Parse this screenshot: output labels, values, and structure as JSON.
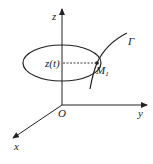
{
  "diagram": {
    "type": "3d-coordinate-system",
    "axes": {
      "z_label": "z",
      "y_label": "y",
      "x_label": "x",
      "origin_label": "O"
    },
    "curve_label": "Γ",
    "point_label": "M",
    "point_subscript": "1",
    "height_label": "z(t)",
    "colors": {
      "stroke": "#222222",
      "background": "#ffffff"
    }
  }
}
